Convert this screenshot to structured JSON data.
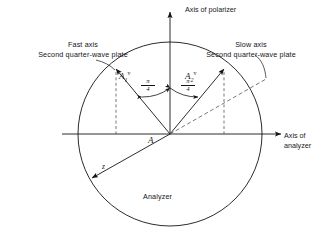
{
  "figure": {
    "type": "optics-vector-diagram",
    "background_color": "#ffffff",
    "line_color": "#141414"
  },
  "circle": {
    "label": "Analyzer",
    "center_x": 170,
    "center_y": 134,
    "radius": 92
  },
  "axes": {
    "vertical": {
      "label": "Axis of polarizer",
      "direction": "up",
      "arrow": true
    },
    "horizontal": {
      "label_line1": "Axis of",
      "label_line2": "analyzer",
      "direction": "right",
      "arrow": true
    },
    "z": {
      "label": "z",
      "direction": "lower-left",
      "arrow": true
    }
  },
  "annotations": {
    "fast_axis_line1": "Fast axis",
    "fast_axis_line2": "Second quarter-wave plate",
    "slow_axis_line1": "Slow axis",
    "slow_axis_line2": "Second quarter-wave plate",
    "origin_label": "A"
  },
  "vectors": [
    {
      "name": "A1",
      "base": "A",
      "subscript": "1",
      "superscript": "v",
      "angle_deg": 135,
      "angle_label_num": "π",
      "angle_label_den": "4",
      "has_projection_dashed": true
    },
    {
      "name": "A2",
      "base": "A",
      "subscript": "2",
      "superscript": "v",
      "angle_deg": 45,
      "angle_label_num": "π",
      "angle_label_den": "4",
      "has_projection_dashed": true
    }
  ],
  "angles": [
    {
      "id": "left-angle",
      "numerator": "π",
      "denominator": "4"
    },
    {
      "id": "right-angle",
      "numerator": "π",
      "denominator": "4"
    }
  ]
}
